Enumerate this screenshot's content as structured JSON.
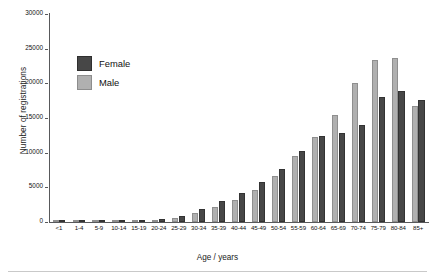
{
  "chart_data": {
    "type": "bar",
    "title": "",
    "xlabel": "Age / years",
    "ylabel": "Number of registrations",
    "ylim": [
      0,
      30000
    ],
    "ytick_values": [
      0,
      5000,
      10000,
      15000,
      20000,
      25000,
      30000
    ],
    "ytick_labels": [
      "0",
      "5000",
      "10000",
      "15000",
      "20000",
      "25000",
      "30000"
    ],
    "grid": false,
    "legend_position": "upper-left-inside",
    "categories": [
      "<1",
      "1-4",
      "5-9",
      "10-14",
      "15-19",
      "20-24",
      "25-29",
      "30-34",
      "35-39",
      "40-44",
      "45-49",
      "50-54",
      "55-59",
      "60-64",
      "65-69",
      "70-74",
      "75-79",
      "80-84",
      "85+"
    ],
    "series": [
      {
        "name": "Male",
        "color": "#b0b0b0",
        "values": [
          120,
          130,
          90,
          100,
          170,
          330,
          620,
          1250,
          2100,
          3150,
          4600,
          6700,
          9500,
          12200,
          15400,
          20100,
          23400,
          23700,
          16800
        ]
      },
      {
        "name": "Female",
        "color": "#474747",
        "values": [
          150,
          120,
          110,
          120,
          210,
          420,
          810,
          1850,
          3050,
          4150,
          5700,
          7700,
          10200,
          12400,
          12900,
          14000,
          18100,
          18900,
          17600
        ]
      }
    ]
  },
  "legend": {
    "items": [
      {
        "label": "Female",
        "color": "#474747"
      },
      {
        "label": "Male",
        "color": "#b0b0b0"
      }
    ]
  }
}
